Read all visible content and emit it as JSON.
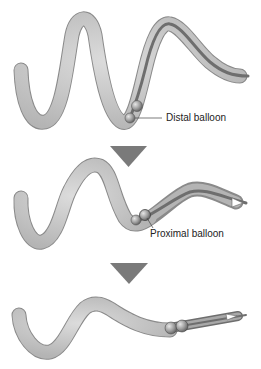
{
  "diagram": {
    "colors": {
      "bead_fill": "#c8c8c8",
      "bead_stroke": "#8a8a8a",
      "overtube_fill": "#9a9a9a",
      "overtube_core": "#6e6e6e",
      "arrow": "#7a7a7a",
      "balloon": "#8c8c8c",
      "label_text": "#222222"
    },
    "stages": [
      {
        "id": 1,
        "description": "Endoscope advanced with distal balloon inflated",
        "label": "Distal balloon"
      },
      {
        "id": 2,
        "description": "Overtube advanced, proximal balloon inflated",
        "label": "Proximal balloon"
      },
      {
        "id": 3,
        "description": "Both balloons inflated, intestine pleated back onto overtube",
        "label": ""
      }
    ],
    "arrows": [
      {
        "direction": "down",
        "between": [
          1,
          2
        ]
      },
      {
        "direction": "down",
        "between": [
          2,
          3
        ]
      }
    ]
  }
}
